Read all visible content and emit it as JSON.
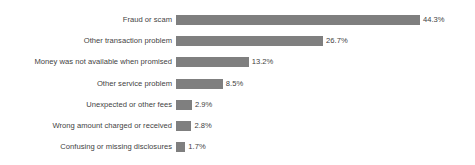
{
  "chart_data": {
    "type": "bar",
    "orientation": "horizontal",
    "title": "",
    "subtitle": "",
    "xlabel": "",
    "ylabel": "",
    "grid": false,
    "legend": false,
    "axis_visible": false,
    "xlim": [
      0,
      44.3
    ],
    "value_suffix": "%",
    "bar_color": "#7f7f7f",
    "text_color": "#3f3f3f",
    "background_color": "#ffffff",
    "categories": [
      "Fraud or scam",
      "Other transaction problem",
      "Money was not available when promised",
      "Other service problem",
      "Unexpected or other fees",
      "Wrong amount charged or received",
      "Confusing or missing disclosures"
    ],
    "values": [
      44.3,
      26.7,
      13.2,
      8.5,
      2.9,
      2.8,
      1.7
    ],
    "value_labels": [
      "44.3%",
      "26.7%",
      "13.2%",
      "8.5%",
      "2.9%",
      "2.8%",
      "1.7%"
    ],
    "bars": [
      {
        "label": "Fraud or scam",
        "value": 44.3,
        "value_label": "44.3%"
      },
      {
        "label": "Other transaction problem",
        "value": 26.7,
        "value_label": "26.7%"
      },
      {
        "label": "Money was not available when promised",
        "value": 13.2,
        "value_label": "13.2%"
      },
      {
        "label": "Other service problem",
        "value": 8.5,
        "value_label": "8.5%"
      },
      {
        "label": "Unexpected or other fees",
        "value": 2.9,
        "value_label": "2.9%"
      },
      {
        "label": "Wrong amount charged or received",
        "value": 2.8,
        "value_label": "2.8%"
      },
      {
        "label": "Confusing or missing disclosures",
        "value": 1.7,
        "value_label": "1.7%"
      }
    ]
  }
}
